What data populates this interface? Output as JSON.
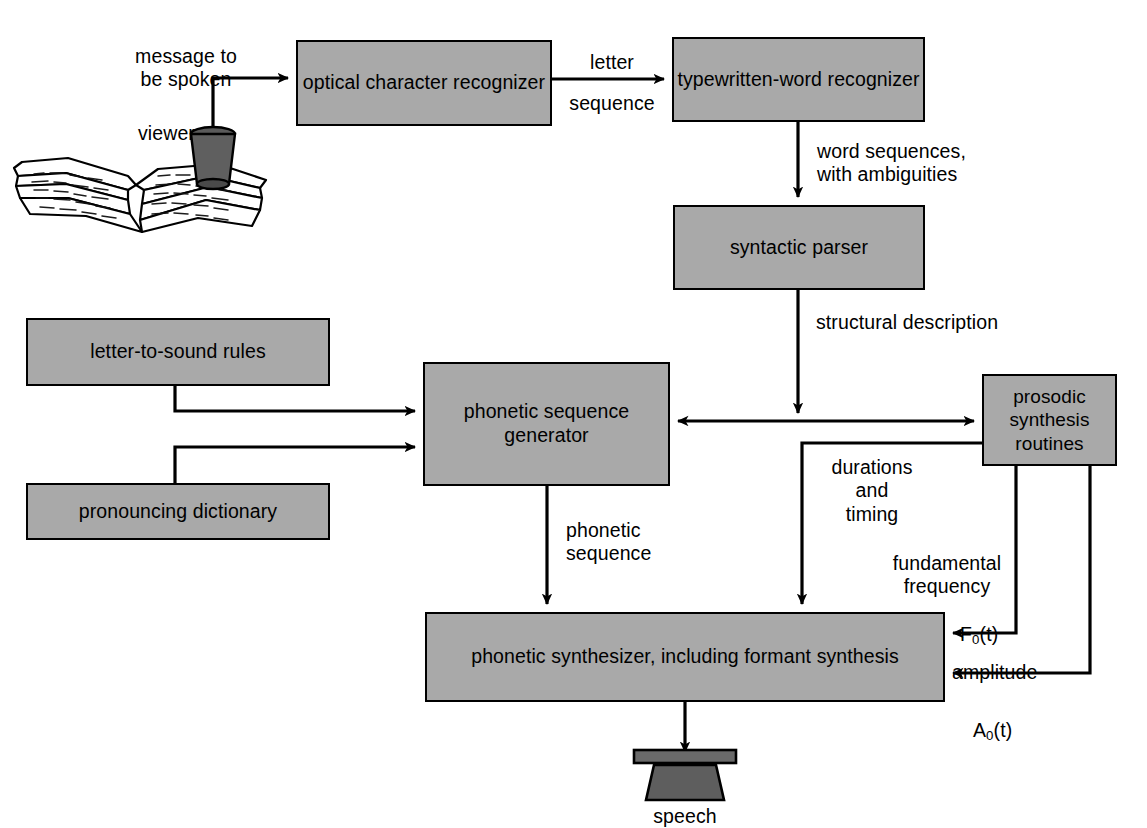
{
  "diagram": {
    "fill_color": "#a9a9a9",
    "stroke_color": "#000000",
    "background": "#ffffff"
  },
  "boxes": {
    "ocr": "optical\ncharacter\nrecognizer",
    "word_recognizer": "typewritten-word\nrecognizer",
    "parser": "syntactic parser",
    "letter_rules": "letter-to-sound rules",
    "dictionary": "pronouncing dictionary",
    "phonetic_generator": "phonetic\nsequence\ngenerator",
    "prosodic": "prosodic\nsynthesis\nroutines",
    "synthesizer": "phonetic  synthesizer,\nincluding formant synthesis"
  },
  "labels": {
    "message": "message to\nbe spoken",
    "viewer": "viewer",
    "letter_sequence": "letter\n\nsequence",
    "word_sequences": "word sequences,\nwith ambiguities",
    "structural_description": "structural description",
    "phonetic_sequence": "phonetic\nsequence",
    "durations": "durations\nand\ntiming",
    "fundamental_frequency": "fundamental\nfrequency",
    "f0": "F",
    "f0_sub": "0",
    "f0_tail": "(t)",
    "amplitude": "amplitude",
    "a0": "A",
    "a0_sub": "0",
    "a0_tail": "(t)",
    "speech": "speech"
  },
  "icons": {
    "book": "open-book-icon",
    "viewer": "viewer-scanner-icon",
    "speaker": "loudspeaker-icon"
  }
}
